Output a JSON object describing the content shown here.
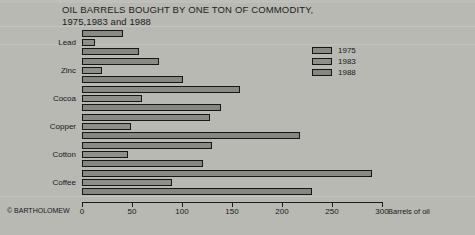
{
  "title": {
    "line1": "OIL BARRELS BOUGHT BY ONE TON OF COMMODITY,",
    "line2": "1975,1983 and 1988"
  },
  "credit": "© BARTHOLOMEW",
  "axis": {
    "xlabel": "Barrels of oil",
    "ticks": [
      "0",
      "50",
      "100",
      "150",
      "200",
      "250",
      "300"
    ]
  },
  "legend": {
    "items": [
      {
        "label": "1975",
        "color": "#8a8a85"
      },
      {
        "label": "1983",
        "color": "#8f8f8a"
      },
      {
        "label": "1988",
        "color": "#878782"
      }
    ]
  },
  "categories": [
    "Lead",
    "Zinc",
    "Cocoa",
    "Copper",
    "Cotton",
    "Coffee"
  ],
  "chart_data": {
    "type": "bar",
    "orientation": "horizontal",
    "title": "OIL BARRELS BOUGHT BY ONE TON OF COMMODITY, 1975,1983 and 1988",
    "xlabel": "Barrels of oil",
    "ylabel": "",
    "xlim": [
      0,
      300
    ],
    "xticks": [
      0,
      50,
      100,
      150,
      200,
      250,
      300
    ],
    "grid": false,
    "legend_position": "upper right",
    "categories": [
      "Lead",
      "Zinc",
      "Cocoa",
      "Copper",
      "Cotton",
      "Coffee"
    ],
    "series": [
      {
        "name": "1975",
        "values": [
          41,
          77,
          158,
          128,
          130,
          290
        ]
      },
      {
        "name": "1983",
        "values": [
          13,
          20,
          60,
          49,
          46,
          90
        ]
      },
      {
        "name": "1988",
        "values": [
          57,
          101,
          139,
          218,
          121,
          230
        ]
      }
    ]
  }
}
